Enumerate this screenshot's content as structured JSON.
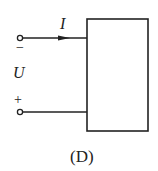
{
  "figure": {
    "label": "(D)",
    "current_label": "I",
    "voltage_label": "U",
    "top_polarity": "−",
    "bottom_polarity": "+",
    "line_color": "#222222"
  }
}
